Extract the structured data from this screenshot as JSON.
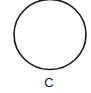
{
  "figure": {
    "shape": "circle",
    "stroke_color": "#1a1a1a",
    "fill_color": "#ffffff",
    "label": "C"
  }
}
